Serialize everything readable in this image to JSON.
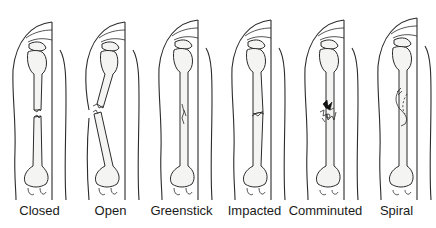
{
  "figure": {
    "panels": [
      {
        "id": "closed",
        "label": "Closed"
      },
      {
        "id": "open",
        "label": "Open"
      },
      {
        "id": "greenstick",
        "label": "Greenstick"
      },
      {
        "id": "impacted",
        "label": "Impacted"
      },
      {
        "id": "comminuted",
        "label": "Comminuted"
      },
      {
        "id": "spiral",
        "label": "Spiral"
      }
    ]
  }
}
